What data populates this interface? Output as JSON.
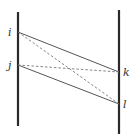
{
  "diagram": {
    "type": "two-line timing/ladder diagram",
    "colors": {
      "axis": "#2a2a2a",
      "solid_edge": "#555555",
      "dashed_edge": "#777777",
      "label": "#333333"
    },
    "axes": [
      {
        "name": "left-axis",
        "x": 18,
        "y1": 12,
        "y2": 126
      },
      {
        "name": "right-axis",
        "x": 119,
        "y1": 10,
        "y2": 134
      }
    ],
    "points": [
      {
        "id": "i",
        "label": "i",
        "x": 18,
        "y": 32
      },
      {
        "id": "j",
        "label": "j",
        "x": 18,
        "y": 65
      },
      {
        "id": "k",
        "label": "k",
        "x": 119,
        "y": 72
      },
      {
        "id": "l",
        "label": "l",
        "x": 119,
        "y": 104
      }
    ],
    "solid_edges": [
      {
        "from": "i",
        "to": "k"
      },
      {
        "from": "j",
        "to": "l"
      }
    ],
    "dashed_edges": [
      {
        "from": "i",
        "to": "l"
      },
      {
        "from": "j",
        "to": "k"
      }
    ]
  }
}
